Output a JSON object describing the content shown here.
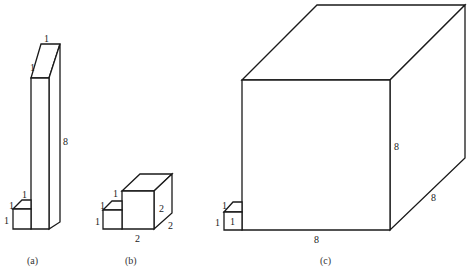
{
  "figure": {
    "panels": [
      {
        "id": "a",
        "caption": "(a)",
        "small_cube": {
          "edge_labels": {
            "height": "1",
            "depth": "1",
            "width": "1"
          }
        },
        "prism": {
          "edge_labels": {
            "top_depth": "1",
            "top_width": "1",
            "height": "8"
          }
        }
      },
      {
        "id": "b",
        "caption": "(b)",
        "small_cube": {
          "edge_labels": {
            "height": "1",
            "depth": "1",
            "width": "1"
          }
        },
        "cube": {
          "edge_labels": {
            "height": "2",
            "depth": "2",
            "width": "2"
          }
        }
      },
      {
        "id": "c",
        "caption": "(c)",
        "small_cube": {
          "edge_labels": {
            "height": "1",
            "depth": "1",
            "front": "1"
          }
        },
        "cube": {
          "edge_labels": {
            "height": "8",
            "depth": "8",
            "width": "8"
          }
        }
      }
    ],
    "colors": {
      "stroke": "#1a1a1a",
      "background": "#ffffff"
    }
  }
}
